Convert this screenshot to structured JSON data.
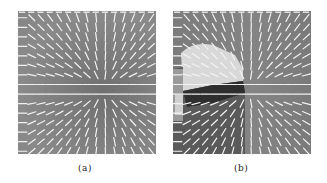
{
  "figure": {
    "panels": [
      {
        "id": "a",
        "caption": "(a)",
        "description": "Orientation / vector field on gray background with singular point near center",
        "grid": {
          "cols": 15,
          "rows": 15
        },
        "singular_point": {
          "x": 0.62,
          "y": 0.55
        }
      },
      {
        "id": "b",
        "caption": "(b)",
        "description": "Orientation / vector field with segmented regions (light upper-left region, dark lower-left region)",
        "grid": {
          "cols": 15,
          "rows": 15
        },
        "singular_point": {
          "x": 0.55,
          "y": 0.55
        }
      }
    ],
    "colors": {
      "background": "#ffffff",
      "field_gray": "#808080",
      "arrow": "#f2f2f2",
      "light_region": "#d8d8d8",
      "dark_region": "#2e2e2e",
      "caption_text": "#222222"
    }
  }
}
